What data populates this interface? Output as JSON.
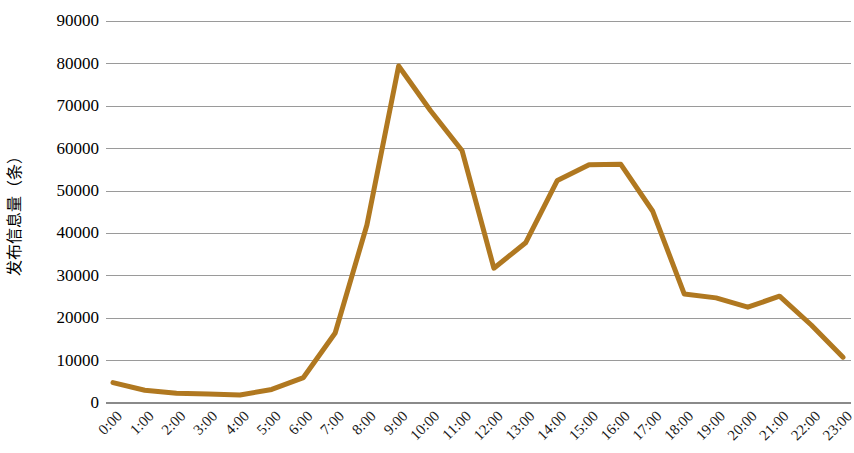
{
  "chart_data": {
    "type": "line",
    "title": "",
    "xlabel": "",
    "ylabel": "发布信息量（条）",
    "categories": [
      "0:00",
      "1:00",
      "2:00",
      "3:00",
      "4:00",
      "5:00",
      "6:00",
      "7:00",
      "8:00",
      "9:00",
      "10:00",
      "11:00",
      "12:00",
      "13:00",
      "14:00",
      "15:00",
      "16:00",
      "17:00",
      "18:00",
      "19:00",
      "20:00",
      "21:00",
      "22:00",
      "23:00"
    ],
    "values": [
      4800,
      3000,
      2300,
      2100,
      1900,
      3200,
      6000,
      16500,
      42000,
      79500,
      69000,
      59500,
      31800,
      37800,
      52500,
      56200,
      56300,
      45300,
      25700,
      24800,
      22600,
      25200,
      18400,
      10800
    ],
    "series": [
      {
        "name": "发布信息量",
        "values": [
          4800,
          3000,
          2300,
          2100,
          1900,
          3200,
          6000,
          16500,
          42000,
          79500,
          69000,
          59500,
          31800,
          37800,
          52500,
          56200,
          56300,
          45300,
          25700,
          24800,
          22600,
          25200,
          18400,
          10800
        ]
      }
    ],
    "ytick_labels": [
      "0",
      "10000",
      "20000",
      "30000",
      "40000",
      "50000",
      "60000",
      "70000",
      "80000",
      "90000"
    ],
    "ytick_values": [
      0,
      10000,
      20000,
      30000,
      40000,
      50000,
      60000,
      70000,
      80000,
      90000
    ],
    "ylim": [
      0,
      90000
    ],
    "grid": true,
    "legend": "none",
    "line_color": "#b07820",
    "grid_color": "#9a9a9a",
    "axis_color": "#8a8a8a",
    "text_color": "#000000",
    "xtick_rotation": -45
  }
}
